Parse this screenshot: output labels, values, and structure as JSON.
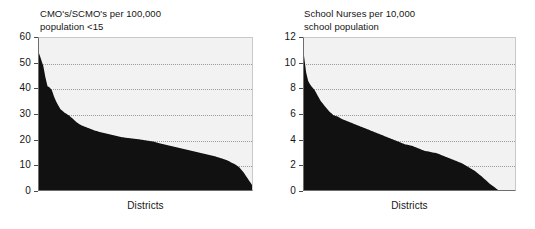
{
  "figure": {
    "background": "#ffffff",
    "plot_background": "#f2f2f2",
    "area_color": "#111111",
    "gridline_color": "#9a9a9a",
    "axis_color": "#4a4a4a"
  },
  "charts": [
    {
      "id": "cmo-scmo-chart",
      "title": "CMO's/SCMO's per 100,000\npopulation <15",
      "xlabel": "Districts",
      "yticks": [
        "0",
        "10",
        "20",
        "30",
        "40",
        "50",
        "60"
      ]
    },
    {
      "id": "school-nurses-chart",
      "title": "School Nurses per 10,000\nschool population",
      "xlabel": "Districts",
      "yticks": [
        "0",
        "2",
        "4",
        "6",
        "8",
        "10",
        "12"
      ]
    }
  ],
  "chart_data": [
    {
      "type": "area",
      "title": "CMO's/SCMO's per 100,000 population <15",
      "xlabel": "Districts",
      "ylabel": "",
      "ylim": [
        0,
        60
      ],
      "yticks": [
        0,
        10,
        20,
        30,
        40,
        50,
        60
      ],
      "grid": true,
      "legend": "none",
      "note": "Districts sorted in descending order of rate; x axis is unlabelled rank of district",
      "x": [
        0,
        1,
        2,
        3,
        4,
        5,
        6,
        7,
        8,
        9,
        10,
        12,
        14,
        16,
        18,
        20,
        23,
        26,
        29,
        32,
        35,
        38,
        41,
        44,
        47,
        50,
        53,
        56,
        59,
        62,
        65,
        68,
        71,
        74,
        77,
        80,
        83,
        86,
        88,
        90,
        92,
        94,
        96,
        98,
        100
      ],
      "values": [
        54.0,
        51.5,
        49.0,
        44.5,
        41.0,
        40.5,
        39.5,
        37.0,
        35.0,
        33.5,
        32.0,
        30.5,
        29.5,
        28.0,
        26.5,
        25.5,
        24.5,
        23.5,
        22.8,
        22.2,
        21.6,
        21.0,
        20.6,
        20.3,
        20.0,
        19.6,
        19.2,
        18.6,
        18.0,
        17.4,
        16.8,
        16.2,
        15.6,
        15.0,
        14.4,
        13.8,
        13.2,
        12.4,
        11.8,
        11.0,
        10.2,
        9.0,
        7.0,
        4.5,
        2.0
      ]
    },
    {
      "type": "area",
      "title": "School Nurses per 10,000 school population",
      "xlabel": "Districts",
      "ylabel": "",
      "ylim": [
        0,
        12
      ],
      "yticks": [
        0,
        2,
        4,
        6,
        8,
        10,
        12
      ],
      "grid": true,
      "legend": "none",
      "note": "Districts sorted in descending order of rate; curve reaches zero before the right edge of the plot",
      "x": [
        0,
        1,
        2,
        3,
        4,
        5,
        6,
        7,
        8,
        10,
        12,
        14,
        16,
        18,
        21,
        24,
        27,
        30,
        33,
        36,
        39,
        42,
        45,
        48,
        51,
        54,
        57,
        60,
        63,
        66,
        69,
        72,
        75,
        78,
        81,
        84,
        86,
        88,
        90,
        92,
        100
      ],
      "values": [
        10.6,
        9.3,
        8.6,
        8.3,
        8.1,
        7.9,
        7.6,
        7.3,
        7.0,
        6.6,
        6.2,
        5.9,
        5.8,
        5.6,
        5.4,
        5.2,
        5.0,
        4.8,
        4.6,
        4.4,
        4.2,
        4.0,
        3.8,
        3.6,
        3.5,
        3.3,
        3.1,
        3.0,
        2.9,
        2.7,
        2.5,
        2.3,
        2.1,
        1.8,
        1.5,
        1.1,
        0.8,
        0.5,
        0.25,
        0.0,
        0.0
      ]
    }
  ]
}
